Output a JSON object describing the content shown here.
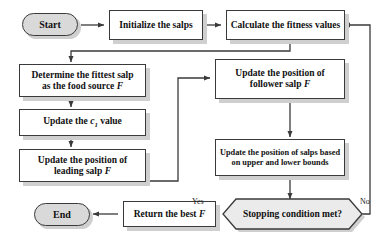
{
  "diagram": {
    "type": "flowchart",
    "background": "#ffffff",
    "line_color": "#3a3a3a",
    "shadow_color": "#cfcfcf",
    "terminator_fill": "#d9d9d9",
    "process_fill": "#ffffff",
    "decision_fill": "#ebebeb"
  },
  "nodes": {
    "start": {
      "label": "Start",
      "shape": "terminator"
    },
    "initialize": {
      "label": "Initialize the salps",
      "shape": "process"
    },
    "calculate_fitness": {
      "label": "Calculate the fitness values",
      "shape": "process"
    },
    "determine_fittest": {
      "shape": "process",
      "line1": "Determine the fittest salp",
      "line2_pre": "as the  food source ",
      "line2_var": "F"
    },
    "update_c1": {
      "shape": "process",
      "pre": "Update the ",
      "var": "c",
      "sub": "1",
      "post": " value"
    },
    "update_leading": {
      "shape": "process",
      "line1": "Update the position of",
      "line2_pre": "leading salp ",
      "line2_var": "F"
    },
    "update_follower": {
      "shape": "process",
      "line1": "Update the position of",
      "line2_pre": "follower salp ",
      "line2_var": "F"
    },
    "update_bounds": {
      "shape": "process",
      "line1": "Update the position of salps based",
      "line2": "on upper and lower bounds"
    },
    "stopping_condition": {
      "label": "Stopping condition met?",
      "shape": "decision"
    },
    "return_best": {
      "shape": "process",
      "pre": "Return the best ",
      "var": "F"
    },
    "end": {
      "label": "End",
      "shape": "terminator"
    }
  },
  "edges": {
    "yes_label": "Yes",
    "no_label": "No"
  }
}
